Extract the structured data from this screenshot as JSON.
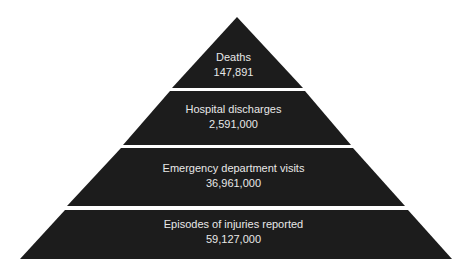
{
  "diagram": {
    "type": "pyramid",
    "fill_color": "#1c1c1c",
    "text_color": "#e8e8e8",
    "levels": [
      {
        "label": "Deaths",
        "value": "147,891"
      },
      {
        "label": "Hospital discharges",
        "value": "2,591,000"
      },
      {
        "label": "Emergency department visits",
        "value": "36,961,000"
      },
      {
        "label": "Episodes of injuries reported",
        "value": "59,127,000"
      }
    ]
  }
}
